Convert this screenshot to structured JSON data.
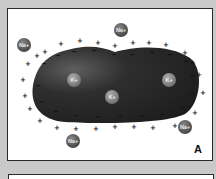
{
  "panels": [
    {
      "id": "A",
      "label": "A",
      "description": "Cell with membrane potential: negative charges inside membrane, positive charges outside",
      "cell": {
        "fill": "#2b2b2b",
        "highlight": "#5a5a5a"
      },
      "inner_charge_symbol": "–",
      "outer_charge_symbol": "+",
      "ions_inside": [
        {
          "label": "K+",
          "x": 74,
          "y": 80
        },
        {
          "label": "K+",
          "x": 112,
          "y": 97
        },
        {
          "label": "K+",
          "x": 169,
          "y": 80
        }
      ],
      "ions_outside": [
        {
          "label": "Na+",
          "x": 24,
          "y": 45
        },
        {
          "label": "Na+",
          "x": 121,
          "y": 30
        },
        {
          "label": "Na+",
          "x": 73,
          "y": 141
        },
        {
          "label": "Na+",
          "x": 185,
          "y": 127
        }
      ]
    },
    {
      "id": "B",
      "label": ""
    }
  ],
  "colors": {
    "background": "#c9c9c9",
    "panel": "#ffffff",
    "border": "#2a2a2a",
    "k_ion": "#8a8a8a",
    "na_ion": "#5c5c5c",
    "charge": "#111111"
  }
}
